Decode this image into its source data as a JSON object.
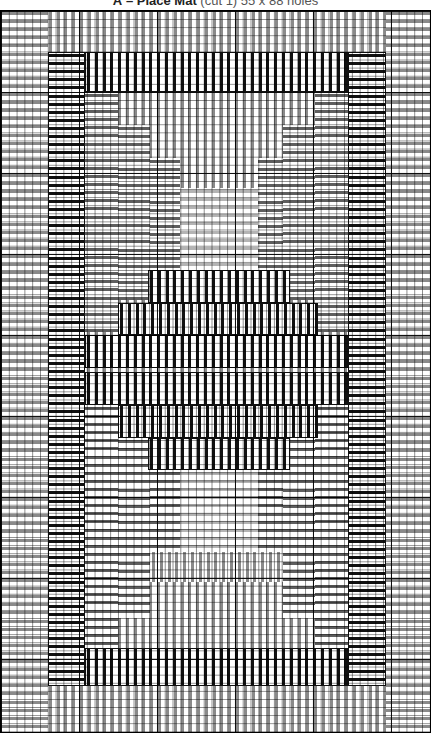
{
  "title": {
    "letter": "A",
    "dash": "–",
    "name": "Place Mat",
    "detail": "(cut 1) 55 x 88 holes"
  },
  "colors": {
    "black": "#111111",
    "grey": "#8a8a8a",
    "dark_grey": "#5e5e5e",
    "light_grey": "#b4b4b4",
    "background": "#ffffff"
  },
  "chart_data": {
    "type": "stitch-chart",
    "title": "A – Place Mat (cut 1) 55 x 88 holes",
    "grid": {
      "columns": 55,
      "rows": 88,
      "major_every": 10
    },
    "regions": [
      {
        "name": "outer-border-top",
        "x": 0,
        "y": 0,
        "w": 431,
        "h": 42,
        "color": "grey",
        "dir": "v"
      },
      {
        "name": "outer-border-bottom",
        "x": 0,
        "y": 676,
        "w": 431,
        "h": 47,
        "color": "grey",
        "dir": "v"
      },
      {
        "name": "outer-border-left",
        "x": 0,
        "y": 0,
        "w": 48,
        "h": 723,
        "color": "grey",
        "dir": "h"
      },
      {
        "name": "outer-border-right",
        "x": 386,
        "y": 0,
        "w": 45,
        "h": 723,
        "color": "grey",
        "dir": "h"
      },
      {
        "name": "black-border-left",
        "x": 48,
        "y": 42,
        "w": 37,
        "h": 634,
        "color": "black",
        "dir": "h"
      },
      {
        "name": "black-border-right",
        "x": 348,
        "y": 42,
        "w": 38,
        "h": 634,
        "color": "black",
        "dir": "h"
      },
      {
        "name": "black-border-top",
        "x": 85,
        "y": 42,
        "w": 263,
        "h": 40,
        "color": "black",
        "dir": "v"
      },
      {
        "name": "black-border-bottom",
        "x": 85,
        "y": 638,
        "w": 263,
        "h": 38,
        "color": "black",
        "dir": "v"
      },
      {
        "name": "inner-field",
        "x": 85,
        "y": 82,
        "w": 263,
        "h": 556,
        "color": "grey",
        "dir": "v"
      },
      {
        "name": "step-left-1-top",
        "x": 85,
        "y": 82,
        "w": 33,
        "h": 240,
        "color": "dark_grey",
        "dir": "h"
      },
      {
        "name": "step-left-2-top",
        "x": 118,
        "y": 115,
        "w": 32,
        "h": 175,
        "color": "dark_grey",
        "dir": "h"
      },
      {
        "name": "step-left-3-top",
        "x": 150,
        "y": 148,
        "w": 30,
        "h": 112,
        "color": "dark_grey",
        "dir": "h"
      },
      {
        "name": "step-right-1-top",
        "x": 315,
        "y": 82,
        "w": 33,
        "h": 240,
        "color": "dark_grey",
        "dir": "h"
      },
      {
        "name": "step-right-2-top",
        "x": 283,
        "y": 115,
        "w": 32,
        "h": 175,
        "color": "dark_grey",
        "dir": "h"
      },
      {
        "name": "step-right-3-top",
        "x": 258,
        "y": 148,
        "w": 25,
        "h": 112,
        "color": "dark_grey",
        "dir": "h"
      },
      {
        "name": "center-light-top",
        "x": 180,
        "y": 178,
        "w": 78,
        "h": 82,
        "color": "light_grey",
        "dir": "h"
      },
      {
        "name": "step-left-1-bottom",
        "x": 85,
        "y": 395,
        "w": 33,
        "h": 243,
        "color": "dark_grey",
        "dir": "h"
      },
      {
        "name": "step-left-2-bottom",
        "x": 118,
        "y": 428,
        "w": 32,
        "h": 180,
        "color": "dark_grey",
        "dir": "h"
      },
      {
        "name": "step-left-3-bottom",
        "x": 150,
        "y": 460,
        "w": 30,
        "h": 112,
        "color": "dark_grey",
        "dir": "h"
      },
      {
        "name": "step-right-1-bottom",
        "x": 315,
        "y": 395,
        "w": 33,
        "h": 243,
        "color": "dark_grey",
        "dir": "h"
      },
      {
        "name": "step-right-2-bottom",
        "x": 283,
        "y": 428,
        "w": 32,
        "h": 180,
        "color": "dark_grey",
        "dir": "h"
      },
      {
        "name": "step-right-3-bottom",
        "x": 258,
        "y": 460,
        "w": 25,
        "h": 112,
        "color": "dark_grey",
        "dir": "h"
      },
      {
        "name": "center-light-bottom",
        "x": 180,
        "y": 460,
        "w": 78,
        "h": 82,
        "color": "light_grey",
        "dir": "h"
      },
      {
        "name": "center-grey-bottom",
        "x": 150,
        "y": 542,
        "w": 133,
        "h": 30,
        "color": "grey",
        "dir": "v"
      },
      {
        "name": "diamond-row-1",
        "x": 148,
        "y": 260,
        "w": 142,
        "h": 33,
        "color": "black",
        "dir": "v"
      },
      {
        "name": "diamond-row-2",
        "x": 118,
        "y": 293,
        "w": 200,
        "h": 32,
        "color": "black",
        "dir": "v"
      },
      {
        "name": "diamond-row-3",
        "x": 85,
        "y": 325,
        "w": 263,
        "h": 33,
        "color": "black",
        "dir": "v"
      },
      {
        "name": "diamond-row-4",
        "x": 85,
        "y": 362,
        "w": 263,
        "h": 33,
        "color": "black",
        "dir": "v"
      },
      {
        "name": "diamond-row-5",
        "x": 118,
        "y": 395,
        "w": 200,
        "h": 33,
        "color": "black",
        "dir": "v"
      },
      {
        "name": "diamond-row-6",
        "x": 148,
        "y": 428,
        "w": 142,
        "h": 32,
        "color": "black",
        "dir": "v"
      }
    ]
  }
}
